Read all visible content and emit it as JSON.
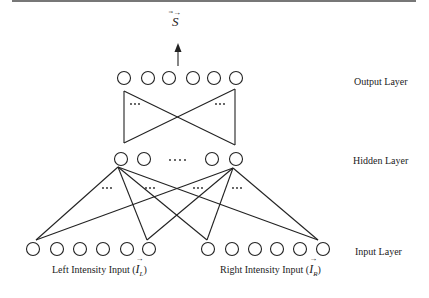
{
  "figure": {
    "output_symbol": "S⃗",
    "output_symbol_base": "S",
    "layers": {
      "output": {
        "label": "Output Layer",
        "nodes": 6
      },
      "hidden": {
        "label": "Hidden Layer",
        "nodes_shown": 4,
        "ellipsis": "····"
      },
      "input": {
        "label": "Input Layer",
        "left_nodes": 6,
        "right_nodes": 6
      }
    },
    "inputs": {
      "left": {
        "text": "Left Intensity Input (",
        "symbol": "I",
        "subscript": "L",
        "close": ")"
      },
      "right": {
        "text": "Right Intensity Input (",
        "symbol": "I",
        "subscript": "R",
        "close": ")"
      }
    },
    "ellipsis_small": "···",
    "colors": {
      "stroke": "#222222",
      "background": "#ffffff",
      "rule": "#777777"
    }
  }
}
